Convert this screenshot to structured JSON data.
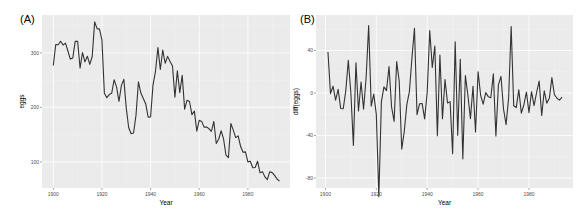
{
  "chart_data": [
    {
      "type": "line",
      "panel_tag": "(A)",
      "title": "",
      "xlabel": "Year",
      "ylabel": "eggs",
      "xlim": [
        1895.35,
        1997.32
      ],
      "ylim": [
        52.1,
        369.5
      ],
      "x_ticks": [
        1900,
        1920,
        1940,
        1960,
        1980
      ],
      "x_tick_labels": [
        "1900",
        "1920",
        "1940",
        "1960",
        "1980"
      ],
      "y_ticks": [
        100,
        200,
        300
      ],
      "y_tick_labels": [
        "100",
        "200",
        "300"
      ],
      "grid": true,
      "legend": "none",
      "series": [
        {
          "name": "eggs",
          "x_start": 1900,
          "x_step": 1,
          "values": [
            276.79,
            315.42,
            314.87,
            321.25,
            314.54,
            317.92,
            303.39,
            288.57,
            290.51,
            321.17,
            321.4,
            272.14,
            300.48,
            283.52,
            293.9,
            278.77,
            293.37,
            356.88,
            344.56,
            343.55,
            323.44,
            225.91,
            217.81,
            223.52,
            225.73,
            250.72,
            237.65,
            210.88,
            240.39,
            251.42,
            198.64,
            162.64,
            151.68,
            152.96,
            185.79,
            246.72,
            226.38,
            216.21,
            206.38,
            181.99,
            182.62,
            241.43,
            265.44,
            309.72,
            269.6,
            305.22,
            280.94,
            293.56,
            284.08,
            275.98,
            218.8,
            266.9,
            227.06,
            258.84,
            196.86,
            213.18,
            210.81,
            186.71,
            193.1,
            156.4,
            176.45,
            174.3,
            163.78,
            164.14,
            160.72,
            156.2,
            174.17,
            133.84,
            141.56,
            157.17,
            142.08,
            112.24,
            107.69,
            170.33,
            158.29,
            144.58,
            147.69,
            128.68,
            117.65,
            118.42,
            99.98,
            101.21,
            89.37,
            89.84,
            101.12,
            80.05,
            82.12,
            72.53,
            67.53,
            81.98,
            80.32,
            75.33,
            68.62,
            64.68
          ]
        }
      ]
    },
    {
      "type": "line",
      "panel_tag": "(B)",
      "title": "",
      "xlabel": "Year",
      "ylabel": "diff(eggs)",
      "xlim": [
        1896.3,
        1997.3
      ],
      "ylim": [
        -89.4,
        73.4
      ],
      "x_ticks": [
        1900,
        1920,
        1940,
        1960,
        1980
      ],
      "x_tick_labels": [
        "1900",
        "1920",
        "1940",
        "1960",
        "1980"
      ],
      "y_ticks": [
        -80,
        -40,
        0,
        40
      ],
      "y_tick_labels": [
        "-80",
        "-40",
        "0",
        "40"
      ],
      "grid": true,
      "legend": "none",
      "series": [
        {
          "name": "diff(eggs)",
          "x_start": 1901,
          "x_step": 1,
          "values": [
            38.63,
            -0.55,
            6.38,
            -6.71,
            3.38,
            -14.53,
            -14.82,
            1.94,
            30.66,
            0.23,
            -49.26,
            28.34,
            -16.96,
            10.38,
            -15.13,
            14.6,
            63.51,
            -12.32,
            -1.01,
            -20.11,
            -97.53,
            -8.1,
            5.71,
            2.21,
            24.99,
            -13.07,
            -26.77,
            29.51,
            11.03,
            -52.78,
            -36.0,
            -10.96,
            1.28,
            32.83,
            60.93,
            -20.34,
            -10.17,
            -9.83,
            -24.39,
            0.63,
            58.81,
            24.01,
            44.28,
            -40.12,
            35.62,
            -24.28,
            12.62,
            -9.48,
            -8.1,
            -57.18,
            48.1,
            -39.84,
            31.78,
            -61.98,
            16.32,
            -2.37,
            -24.1,
            6.39,
            -36.7,
            20.05,
            -2.15,
            -10.52,
            0.36,
            -3.42,
            -4.52,
            17.97,
            -40.33,
            7.72,
            15.61,
            -15.09,
            -29.84,
            -4.55,
            62.64,
            -12.04,
            -13.71,
            3.11,
            -19.01,
            -11.03,
            0.77,
            -18.44,
            1.23,
            -11.84,
            0.47,
            11.28,
            -21.07,
            2.07,
            -9.59,
            -5.0,
            14.45,
            -1.66,
            -4.99,
            -6.71,
            -3.94
          ]
        }
      ]
    }
  ]
}
